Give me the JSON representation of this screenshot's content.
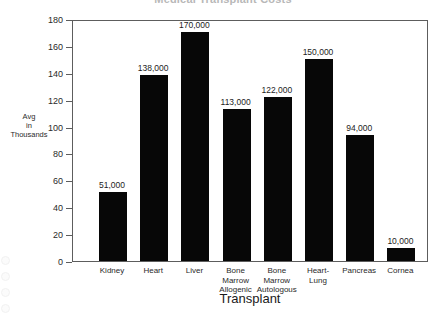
{
  "chart_data": {
    "type": "bar",
    "title": "Medical Transplant Costs",
    "xlabel": "Transplant",
    "ylabel": "Avg in Thousands",
    "ylabel_lines": [
      "Avg",
      "in",
      "Thousands"
    ],
    "categories": [
      "Kidney",
      "Heart",
      "Liver",
      "Bone Marrow Allogenic",
      "Bone Marrow Autologous",
      "Heart-Lung",
      "Pancreas",
      "Cornea"
    ],
    "category_label_lines": [
      [
        "Kidney"
      ],
      [
        "Heart"
      ],
      [
        "Liver"
      ],
      [
        "Bone",
        "Marrow",
        "Allogenic"
      ],
      [
        "Bone",
        "Marrow",
        "Autologous"
      ],
      [
        "Heart-",
        "Lung"
      ],
      [
        "Pancreas"
      ],
      [
        "Cornea"
      ]
    ],
    "values": [
      51,
      138,
      170,
      113,
      122,
      150,
      94,
      10
    ],
    "value_labels": [
      "51,000",
      "138,000",
      "170,000",
      "113,000",
      "122,000",
      "150,000",
      "94,000",
      "10,000"
    ],
    "ylim": [
      0,
      180
    ],
    "ytick_values": [
      0,
      20,
      40,
      60,
      80,
      100,
      120,
      140,
      160,
      180
    ],
    "ytick_labels": [
      "0",
      "20",
      "40",
      "60",
      "80",
      "100",
      "120",
      "140",
      "160",
      "180"
    ],
    "grid": false,
    "legend": false,
    "bar_color": "#070707",
    "axis_color": "#5d5d5d",
    "background_color": "#ffffff"
  }
}
